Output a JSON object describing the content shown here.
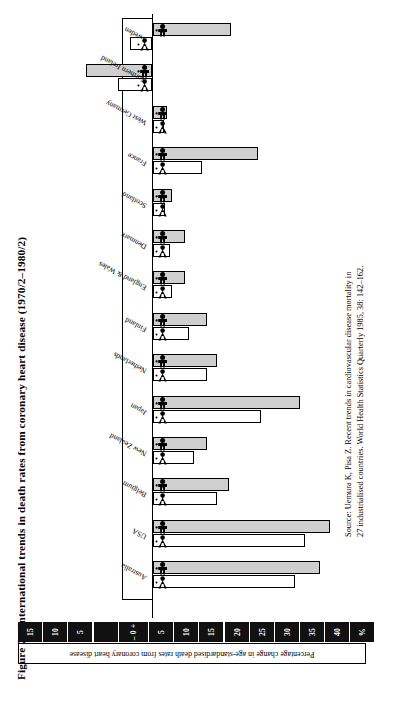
{
  "figure": {
    "number": "Figure 7",
    "title": "International trends in death rates from coronary heart disease (1970/2–1980/2)"
  },
  "source": {
    "text": "Source: Uemura K, Pisa Z. Recent trends in cardiovascular disease mortality in 27 industrialised countries. World Health Statistics Quarterly 1985, 38: 142–162."
  },
  "axis": {
    "caption": "Percentage change in age-standardised death rates from coronary heart disease",
    "unit_label": "%",
    "zero_label": "– 0 +",
    "ticks": [
      "15",
      "10",
      "5",
      "",
      "– 0 +",
      "5",
      "10",
      "15",
      "20",
      "25",
      "30",
      "35",
      "40",
      "%"
    ]
  },
  "legend": {
    "male_icon": "male-figure-icon",
    "female_icon": "female-figure-icon",
    "male_label": "Males",
    "female_label": "Females"
  },
  "colors": {
    "male_bar": "#cfcfcf",
    "female_bar": "#ffffff",
    "outline": "#000000",
    "tick_box": "#111111"
  },
  "chart_data": {
    "type": "bar",
    "title": "International trends in death rates from coronary heart disease (1970/2–1980/2)",
    "xlabel": "Percentage change in age-standardised death rates from coronary heart disease",
    "ylabel": "",
    "xlim": [
      -18,
      42
    ],
    "grid": false,
    "orientation": "horizontal",
    "legend_position": "in-bar-icons",
    "categories": [
      "Sweden",
      "Northern Ireland",
      "West Germany",
      "France",
      "Scotland",
      "Denmark",
      "England & Wales",
      "Finland",
      "Netherlands",
      "Japan",
      "New Zealand",
      "Belgium",
      "USA",
      "Australia"
    ],
    "series": [
      {
        "name": "Males",
        "values": [
          16.0,
          -13.5,
          3.0,
          21.5,
          4.0,
          6.5,
          6.5,
          11.0,
          13.0,
          30.0,
          11.0,
          15.5,
          36.0,
          34.0
        ]
      },
      {
        "name": "Females",
        "values": [
          -4.5,
          -7.0,
          1.0,
          10.0,
          2.5,
          3.5,
          4.0,
          7.5,
          11.0,
          22.0,
          8.5,
          13.0,
          31.0,
          29.0
        ]
      }
    ]
  }
}
